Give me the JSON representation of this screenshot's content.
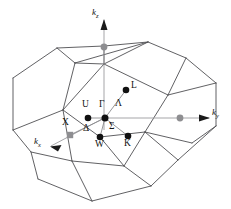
{
  "figure": {
    "type": "brillouin-zone-diagram",
    "lattice": "fcc",
    "shape": "truncated octahedron",
    "background_color": "#ffffff",
    "edge_color": "#4f4f52",
    "axis_color": "#9b9b9e",
    "path_color": "#8a8a8d",
    "point_black_color": "#111111",
    "point_gray_color": "#8e8e91"
  },
  "axes": [
    {
      "name": "kz",
      "label": "k",
      "sub": "z",
      "label_x": 92,
      "label_y": 10,
      "tip_x": 104,
      "tip_y": 20,
      "tail_x": 104,
      "tail_y": 118
    },
    {
      "name": "ky",
      "label": "k",
      "sub": "y",
      "label_x": 212,
      "label_y": 110,
      "tip_x": 209,
      "tip_y": 118,
      "tail_x": 104,
      "tail_y": 118
    },
    {
      "name": "kx",
      "label": "k",
      "sub": "x",
      "label_x": 36,
      "label_y": 142,
      "tip_x": 50,
      "tip_y": 146,
      "tail_x": 104,
      "tail_y": 118
    }
  ],
  "points": [
    {
      "name": "Gamma",
      "label": "Γ",
      "marker": "black-dot",
      "x": 105,
      "y": 118,
      "label_x": 99,
      "label_y": 104
    },
    {
      "name": "U",
      "label": "U",
      "marker": "black-dot",
      "x": 88,
      "y": 118,
      "label_x": 83,
      "label_y": 104
    },
    {
      "name": "L",
      "label": "L",
      "marker": "black-dot",
      "x": 126,
      "y": 90,
      "label_x": 131,
      "label_y": 84
    },
    {
      "name": "W",
      "label": "W",
      "marker": "black-dot",
      "x": 100,
      "y": 137,
      "label_x": 96,
      "label_y": 141
    },
    {
      "name": "K",
      "label": "K",
      "marker": "black-dot",
      "x": 128,
      "y": 136,
      "label_x": 125,
      "label_y": 140
    },
    {
      "name": "X-front",
      "label": "X",
      "marker": "gray-square",
      "x": 70,
      "y": 135,
      "label_x": 63,
      "label_y": 122
    },
    {
      "name": "X-top",
      "label": "",
      "marker": "gray-dot",
      "x": 104,
      "y": 47,
      "label_x": 0,
      "label_y": 0
    },
    {
      "name": "X-right",
      "label": "",
      "marker": "gray-dot",
      "x": 180,
      "y": 118,
      "label_x": 0,
      "label_y": 0
    }
  ],
  "symmetry_lines": [
    {
      "name": "Lambda",
      "label": "Λ",
      "from": "Gamma",
      "to": "L",
      "label_x": 116,
      "label_y": 103
    },
    {
      "name": "Sigma",
      "label": "Σ",
      "from": "Gamma",
      "to": "K",
      "label_x": 111,
      "label_y": 126
    },
    {
      "name": "Delta",
      "label": "Δ",
      "from": "Gamma",
      "to": "X-front",
      "label_x": 85,
      "label_y": 128
    }
  ],
  "geometry": {
    "outline": "M 104,46 L 57,48 L 13,78 L 13,130 L 31,152 L 38,179 L 92,201 L 151,186 L 178,160 L 216,126 L 216,83 L 186,58 L 148,42 Z",
    "edges": [
      "M 104,46 L 57,48",
      "M 57,48 L 13,78",
      "M 13,78 L 13,130",
      "M 13,130 L 31,152",
      "M 31,152 L 38,179",
      "M 38,179 L 92,201",
      "M 92,201 L 151,186",
      "M 151,186 L 178,160",
      "M 178,160 L 216,126",
      "M 216,126 L 216,83",
      "M 216,83 L 186,58",
      "M 186,58 L 148,42",
      "M 148,42 L 104,46",
      "M 57,48 L 75,63",
      "M 75,63 L 148,42",
      "M 75,63 L 104,64",
      "M 104,64 L 148,42",
      "M 104,46 L 104,64",
      "M 75,63 L 63,110",
      "M 63,110 L 13,130",
      "M 63,110 L 72,161",
      "M 72,161 L 31,152",
      "M 72,161 L 124,166",
      "M 124,166 L 151,186",
      "M 124,166 L 145,132",
      "M 145,132 L 178,160",
      "M 145,132 L 168,95",
      "M 168,95 L 186,58",
      "M 168,95 L 216,83",
      "M 145,132 L 192,143",
      "M 192,143 L 216,126",
      "M 104,64 L 168,95",
      "M 63,110 L 104,64",
      "M 63,110 L 100,137",
      "M 100,137 L 124,166",
      "M 100,137 L 145,132",
      "M 72,161 L 92,201"
    ]
  }
}
